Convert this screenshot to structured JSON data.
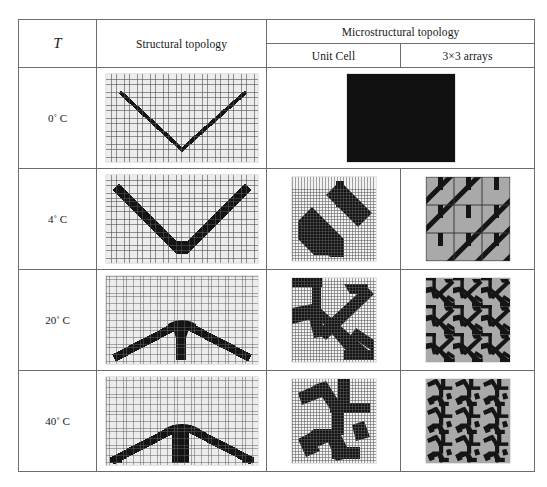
{
  "table": {
    "header": {
      "temperature_label": "T",
      "structural_label": "Structural topology",
      "microstructural_label": "Microstructural topology",
      "unit_cell_label": "Unit Cell",
      "arrays_label": "3×3 arrays"
    },
    "rows": [
      {
        "temperature": "0˚ C",
        "structural_figure": "thin-v-truss",
        "unit_cell_figure": "solid-black-square",
        "array_figure": "none"
      },
      {
        "temperature": "4˚ C",
        "structural_figure": "thick-v-truss",
        "unit_cell_figure": "two-diagonal-bars",
        "array_figure": "diagonal-stripe-lattice"
      },
      {
        "temperature": "20˚ C",
        "structural_figure": "arch-with-center-stem",
        "unit_cell_figure": "angled-truss-cell",
        "array_figure": "dense-triangular-lattice"
      },
      {
        "temperature": "40˚ C",
        "structural_figure": "flat-arch-with-column",
        "unit_cell_figure": "branched-truss-cell",
        "array_figure": "zigzag-triangular-lattice"
      }
    ]
  },
  "colors": {
    "material": "#111111",
    "void": "#ececec",
    "array_background": "#a9a9a9",
    "grid_line": "#5a5a5a",
    "table_border": "#6d6d6d"
  }
}
